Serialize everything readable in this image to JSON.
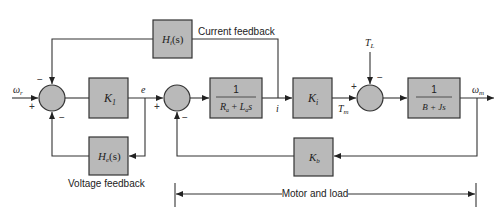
{
  "diagram": {
    "type": "control-block-diagram",
    "signals": {
      "reference_speed": "ω",
      "reference_speed_sub": "r",
      "error": "e",
      "current": "i",
      "motor_torque": "T",
      "motor_torque_sub": "m",
      "load_torque": "T",
      "load_torque_sub": "L",
      "output_speed": "ω",
      "output_speed_sub": "m"
    },
    "blocks": {
      "k1": {
        "main": "K",
        "sub": "1"
      },
      "hi": {
        "main": "H",
        "sub": "i",
        "arg": "(s)"
      },
      "he": {
        "main": "H",
        "sub": "e",
        "arg": "(s)"
      },
      "armature": {
        "num": "1",
        "den_a": "R",
        "den_a_sub": "a",
        "den_plus": "+",
        "den_b": "L",
        "den_b_sub": "a",
        "den_s": "s"
      },
      "ki": {
        "main": "K",
        "sub": "i"
      },
      "mech": {
        "num": "1",
        "den": "B + Js"
      },
      "kb": {
        "main": "K",
        "sub": "b"
      }
    },
    "labels": {
      "current_feedback": "Current feedback",
      "voltage_feedback": "Voltage feedback",
      "motor_and_load": "Motor and load"
    },
    "signs": {
      "sum1_top": "−",
      "sum1_left": "+",
      "sum1_bottom": "−",
      "sum2_left": "+",
      "sum2_bottom": "−",
      "sum3_left": "+",
      "sum3_top": "−"
    },
    "colors": {
      "block_fill": "#b9b9b9",
      "line": "#333333"
    }
  }
}
